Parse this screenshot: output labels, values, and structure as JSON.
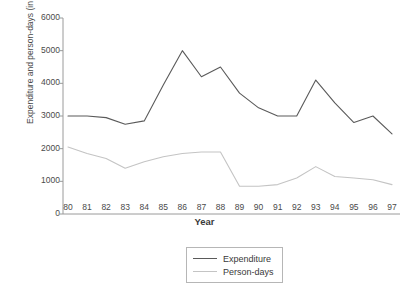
{
  "chart_data": {
    "type": "line",
    "title": "",
    "xlabel": "Year",
    "ylabel": "Expenditure and person-days (in lakhs)",
    "categories": [
      "80",
      "81",
      "82",
      "83",
      "84",
      "85",
      "86",
      "87",
      "88",
      "89",
      "90",
      "91",
      "92",
      "93",
      "94",
      "95",
      "96",
      "97"
    ],
    "x": [
      "80",
      "81",
      "82",
      "83",
      "84",
      "85",
      "86",
      "87",
      "88",
      "89",
      "90",
      "91",
      "92",
      "93",
      "94",
      "95",
      "96",
      "97"
    ],
    "xlim": [
      "80",
      "97"
    ],
    "ylim": [
      0,
      6000
    ],
    "yticks": [
      0,
      1000,
      2000,
      3000,
      4000,
      5000,
      6000
    ],
    "grid": false,
    "legend_position": "bottom-center",
    "series": [
      {
        "name": "Expenditure",
        "color": "#5a5a5a",
        "values": [
          3000,
          3000,
          2950,
          2750,
          2850,
          3950,
          5000,
          4200,
          4500,
          3700,
          3250,
          3000,
          3000,
          4100,
          3400,
          2800,
          3000,
          2450
        ]
      },
      {
        "name": "Person-days",
        "color": "#c4c4c4",
        "values": [
          2050,
          1850,
          1700,
          1400,
          1600,
          1750,
          1850,
          1900,
          1900,
          850,
          850,
          900,
          1100,
          1450,
          1150,
          1100,
          1050,
          900
        ]
      }
    ]
  },
  "legend": {
    "items": [
      {
        "label": "Expenditure",
        "color": "#5a5a5a"
      },
      {
        "label": "Person-days",
        "color": "#c4c4c4"
      }
    ]
  }
}
